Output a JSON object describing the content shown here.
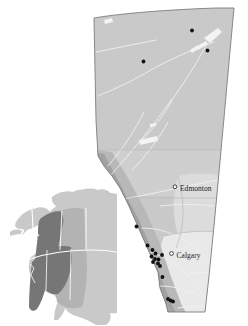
{
  "figure": {
    "background_color": "#ffffff",
    "width": 248,
    "height": 326
  },
  "main_map": {
    "name": "Alberta",
    "border_color": "#7a7a7a",
    "regions": [
      {
        "id": "north-boreal",
        "label": "Northern boreal plain",
        "fill": "#c9c9c9"
      },
      {
        "id": "central-parkland",
        "label": "Central parkland",
        "fill": "#cccccc"
      },
      {
        "id": "rocky-mountains",
        "label": "Rocky Mountain belt",
        "fill": "#a3a3a3"
      },
      {
        "id": "foothills",
        "label": "Foothills",
        "fill": "#b5b5b5"
      },
      {
        "id": "southeast-prairie",
        "label": "Southeastern prairie",
        "fill": "#e4e4e4"
      },
      {
        "id": "east-lowland",
        "label": "Eastern lowland",
        "fill": "#dadada"
      }
    ],
    "hydrography": {
      "river_color": "#ffffff",
      "lake_color": "#f2f2f2",
      "rivers": [
        "Peace River",
        "Athabasca River",
        "North Saskatchewan River",
        "Red Deer River",
        "Bow River",
        "South Saskatchewan River",
        "Milk River"
      ],
      "lakes": [
        "Lake Athabasca",
        "Lesser Slave Lake",
        "Utikuma Lake",
        "Bistcho Lake",
        "Cold Lake"
      ]
    },
    "cities": [
      {
        "name": "Edmonton",
        "marker": "open-circle",
        "x": 175.0,
        "y": 186.8,
        "label_x": 180.0,
        "label_y": 191.0
      },
      {
        "name": "Calgary",
        "marker": "open-circle",
        "x": 171.5,
        "y": 253.5,
        "label_x": 176.5,
        "label_y": 257.5
      }
    ],
    "sample_sites": {
      "marker": "filled-circle",
      "marker_color": "#111111",
      "marker_radius": 1.9,
      "count": 18,
      "points": [
        {
          "x": 192.0,
          "y": 30.5
        },
        {
          "x": 207.5,
          "y": 50.5
        },
        {
          "x": 143.5,
          "y": 61.5
        },
        {
          "x": 136.5,
          "y": 226.5
        },
        {
          "x": 147.5,
          "y": 245.5
        },
        {
          "x": 152.5,
          "y": 250.0
        },
        {
          "x": 155.5,
          "y": 253.5
        },
        {
          "x": 162.0,
          "y": 255.0
        },
        {
          "x": 151.5,
          "y": 256.5
        },
        {
          "x": 155.0,
          "y": 259.0
        },
        {
          "x": 158.5,
          "y": 259.5
        },
        {
          "x": 153.0,
          "y": 262.0
        },
        {
          "x": 158.0,
          "y": 263.5
        },
        {
          "x": 160.0,
          "y": 266.0
        },
        {
          "x": 162.5,
          "y": 277.0
        },
        {
          "x": 168.0,
          "y": 299.0
        },
        {
          "x": 170.5,
          "y": 300.5
        },
        {
          "x": 173.0,
          "y": 301.5
        }
      ]
    }
  },
  "inset_map": {
    "name": "North America",
    "land_fill": "#c9c9c9",
    "highlight_fill": "#767676",
    "mid_fill": "#b3b3b3",
    "border_color": "#ffffff",
    "highlight_label": "Western Cordillera study range",
    "countries": [
      "Canada",
      "United States",
      "Mexico"
    ],
    "border_line_label": "Canada–United States border"
  }
}
